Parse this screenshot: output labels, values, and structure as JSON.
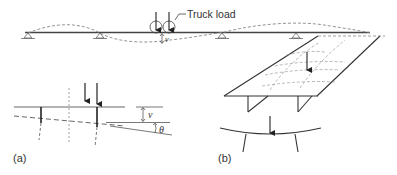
{
  "diagram": {
    "top_beam": {
      "annotation": "Truck load",
      "deflection_symbol": "v",
      "supports": 3
    },
    "panel_a": {
      "label": "(a)",
      "deflection_symbol": "v",
      "rotation_symbol": "θ"
    },
    "panel_b": {
      "label": "(b)"
    },
    "colors": {
      "line": "#333333",
      "dashed": "#888888"
    }
  }
}
